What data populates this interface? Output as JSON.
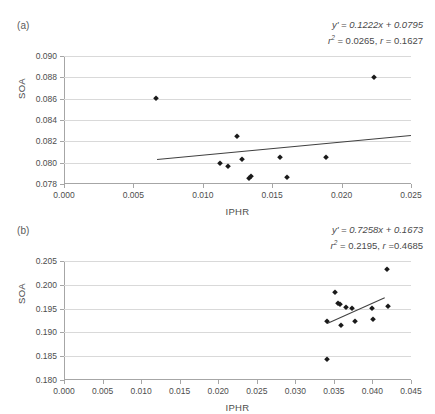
{
  "figure": {
    "panels": [
      {
        "label": "(a)",
        "equation_line1": "y' = 0.1222x + 0.0795",
        "equation_line2_r2": "r",
        "equation_line2_r2_sup": "2",
        "equation_line2_rest": " = 0.0265, ",
        "equation_line2_r": "r",
        "equation_line2_rval": " = 0.1627"
      },
      {
        "label": "(b)",
        "equation_line1": "y' = 0.7258x + 0.1673",
        "equation_line2_r2": "r",
        "equation_line2_r2_sup": "2",
        "equation_line2_rest": " = 0.2195, ",
        "equation_line2_r": "r",
        "equation_line2_rval": " =0.4685"
      }
    ]
  },
  "chart_data": [
    {
      "type": "scatter",
      "panel": "(a)",
      "title": "",
      "xlabel": "IPHR",
      "ylabel": "SOA",
      "xlim": [
        0.0,
        0.025
      ],
      "ylim": [
        0.078,
        0.09
      ],
      "xticks": [
        0.0,
        0.005,
        0.01,
        0.015,
        0.02,
        0.025
      ],
      "yticks": [
        0.078,
        0.08,
        0.082,
        0.084,
        0.086,
        0.088,
        0.09
      ],
      "xticklabels": [
        "0.000",
        "0.005",
        "0.010",
        "0.015",
        "0.020",
        "0.025"
      ],
      "yticklabels": [
        "0.078",
        "0.080",
        "0.082",
        "0.084",
        "0.086",
        "0.088",
        "0.090"
      ],
      "grid": "horizontal",
      "legend": "none",
      "marker_color": "#1a1a1a",
      "trendline_color": "#404040",
      "annotation": "y' = 0.1222x + 0.0795; r2 = 0.0265, r = 0.1627",
      "regression": {
        "slope": 0.1222,
        "intercept": 0.0795,
        "r_squared": 0.0265,
        "r": 0.1627,
        "x_start": 0.0067,
        "x_end": 0.025,
        "y_start": 0.08032,
        "y_end": 0.08256
      },
      "points": [
        {
          "x": 0.00665,
          "y": 0.08605
        },
        {
          "x": 0.01125,
          "y": 0.07997
        },
        {
          "x": 0.01185,
          "y": 0.07973
        },
        {
          "x": 0.01245,
          "y": 0.08248
        },
        {
          "x": 0.01285,
          "y": 0.0803
        },
        {
          "x": 0.0133,
          "y": 0.07854
        },
        {
          "x": 0.01345,
          "y": 0.07875
        },
        {
          "x": 0.01558,
          "y": 0.08055
        },
        {
          "x": 0.01605,
          "y": 0.07868
        },
        {
          "x": 0.0189,
          "y": 0.08053
        },
        {
          "x": 0.02235,
          "y": 0.08805
        }
      ]
    },
    {
      "type": "scatter",
      "panel": "(b)",
      "title": "",
      "xlabel": "IPHR",
      "ylabel": "SOA",
      "xlim": [
        0.0,
        0.045
      ],
      "ylim": [
        0.18,
        0.205
      ],
      "xticks": [
        0.0,
        0.005,
        0.01,
        0.015,
        0.02,
        0.025,
        0.03,
        0.035,
        0.04,
        0.045
      ],
      "yticks": [
        0.18,
        0.185,
        0.19,
        0.195,
        0.2,
        0.205
      ],
      "xticklabels": [
        "0.000",
        "0.005",
        "0.010",
        "0.015",
        "0.020",
        "0.025",
        "0.030",
        "0.035",
        "0.040",
        "0.045"
      ],
      "yticklabels": [
        "0.180",
        "0.185",
        "0.190",
        "0.195",
        "0.200",
        "0.205"
      ],
      "grid": "horizontal",
      "legend": "none",
      "marker_color": "#1a1a1a",
      "trendline_color": "#404040",
      "annotation": "y' = 0.7258x + 0.1673; r2 = 0.2195, r =0.4685",
      "regression": {
        "slope": 0.7258,
        "intercept": 0.1673,
        "r_squared": 0.2195,
        "r": 0.4685,
        "x_start": 0.0341,
        "x_end": 0.0415,
        "y_start": 0.19205,
        "y_end": 0.19742
      },
      "points": [
        {
          "x": 0.03405,
          "y": 0.18435
        },
        {
          "x": 0.0341,
          "y": 0.19245
        },
        {
          "x": 0.0351,
          "y": 0.19845
        },
        {
          "x": 0.03555,
          "y": 0.19625
        },
        {
          "x": 0.03575,
          "y": 0.196
        },
        {
          "x": 0.03595,
          "y": 0.1916
        },
        {
          "x": 0.0366,
          "y": 0.1954
        },
        {
          "x": 0.0374,
          "y": 0.19515
        },
        {
          "x": 0.03775,
          "y": 0.1923
        },
        {
          "x": 0.03995,
          "y": 0.1952
        },
        {
          "x": 0.0401,
          "y": 0.19275
        },
        {
          "x": 0.04195,
          "y": 0.20335
        },
        {
          "x": 0.042,
          "y": 0.1955
        }
      ]
    }
  ]
}
